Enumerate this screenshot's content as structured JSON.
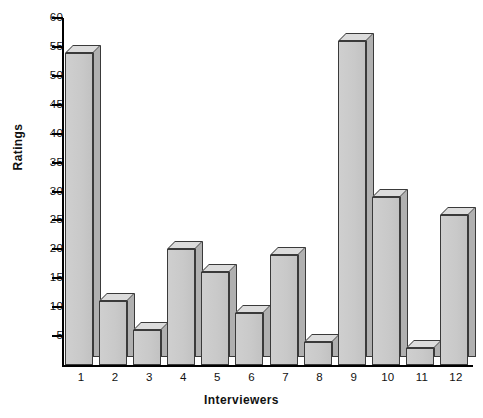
{
  "chart_data": {
    "type": "bar",
    "title": "",
    "xlabel": "Interviewers",
    "ylabel": "Ratings",
    "categories": [
      "1",
      "2",
      "3",
      "4",
      "5",
      "6",
      "7",
      "8",
      "9",
      "10",
      "11",
      "12"
    ],
    "values": [
      54,
      11,
      6,
      20,
      16,
      9,
      19,
      4,
      56,
      29,
      3,
      26
    ],
    "ylim": [
      0,
      60
    ],
    "yticks": [
      5,
      10,
      15,
      20,
      25,
      30,
      35,
      40,
      45,
      50,
      55,
      60
    ],
    "ytick_labels": [
      "5",
      "10",
      "15",
      "20",
      "25",
      "30",
      "35",
      "40",
      "45",
      "50",
      "55",
      "60"
    ],
    "grid": false,
    "legend": false,
    "style": {
      "bar_face_color": "#c9c9c9",
      "bar_top_color": "#dcdcdc",
      "bar_side_color": "#b0b0b0",
      "bar_edge_color": "#3a3a3a",
      "axis_color": "#000000",
      "background": "#ffffff",
      "three_d": true
    }
  }
}
